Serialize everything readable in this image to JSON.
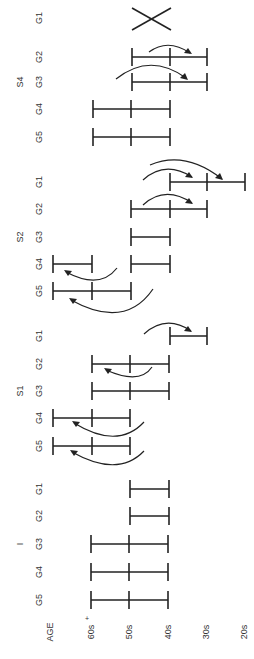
{
  "diagram": {
    "orientation": "rotated-90-ccw",
    "axis": {
      "title": "AGE",
      "ticks": [
        {
          "label": "60s",
          "sup": "+",
          "x": 91
        },
        {
          "label": "50s",
          "sup": "",
          "x": 129
        },
        {
          "label": "40s",
          "sup": "",
          "x": 168
        },
        {
          "label": "30s",
          "sup": "",
          "x": 206
        },
        {
          "label": "20s",
          "sup": "",
          "x": 244
        }
      ]
    },
    "sections": [
      {
        "label": "S4",
        "y": 82,
        "rows": [
          {
            "group": "G1",
            "y": 18,
            "marker": "cross",
            "ticks": []
          },
          {
            "group": "G2",
            "y": 57,
            "ticks": [
              "40s",
              "30s"
            ],
            "extra_left": "50s"
          },
          {
            "group": "G3",
            "y": 82,
            "ticks": [
              "50s",
              "40s",
              "30s"
            ]
          },
          {
            "group": "G4",
            "y": 109,
            "ticks": [
              "60s+",
              "50s",
              "40s"
            ]
          },
          {
            "group": "G5",
            "y": 137,
            "ticks": [
              "60s+",
              "50s",
              "40s"
            ]
          }
        ]
      },
      {
        "label": "S2",
        "y": 237,
        "rows": [
          {
            "group": "G1",
            "y": 182,
            "ticks": [
              "40s",
              "30s",
              "20s"
            ]
          },
          {
            "group": "G2",
            "y": 209,
            "ticks": [
              "50s",
              "40s",
              "30s"
            ]
          },
          {
            "group": "G3",
            "y": 237,
            "ticks": [
              "50s",
              "40s"
            ]
          },
          {
            "group": "G4",
            "y": 264,
            "ticks": [
              "70s",
              "60s+"
            ],
            "second_bar": [
              "50s",
              "40s"
            ]
          },
          {
            "group": "G5",
            "y": 291,
            "ticks": [
              "70s",
              "60s+",
              "50s"
            ]
          }
        ]
      },
      {
        "label": "S1",
        "y": 391,
        "rows": [
          {
            "group": "G1",
            "y": 336,
            "ticks": [
              "40s",
              "30s"
            ]
          },
          {
            "group": "G2",
            "y": 364,
            "ticks": [
              "60s+",
              "50s",
              "40s"
            ]
          },
          {
            "group": "G3",
            "y": 391,
            "ticks": [
              "60s+",
              "50s",
              "40s"
            ]
          },
          {
            "group": "G4",
            "y": 418,
            "ticks": [
              "70s",
              "60s+",
              "50s"
            ]
          },
          {
            "group": "G5",
            "y": 446,
            "ticks": [
              "70s",
              "60s+",
              "50s"
            ]
          }
        ]
      },
      {
        "label": "I",
        "y": 544,
        "rows": [
          {
            "group": "G1",
            "y": 489,
            "ticks": [
              "50s",
              "40s"
            ]
          },
          {
            "group": "G2",
            "y": 516,
            "ticks": [
              "50s",
              "40s"
            ]
          },
          {
            "group": "G3",
            "y": 544,
            "ticks": [
              "60s+",
              "50s",
              "40s"
            ]
          },
          {
            "group": "G4",
            "y": 572,
            "ticks": [
              "60s+",
              "50s",
              "40s"
            ]
          },
          {
            "group": "G5",
            "y": 600,
            "ticks": [
              "60s+",
              "50s",
              "40s"
            ]
          }
        ]
      }
    ],
    "arrows": [
      {
        "section": "S4",
        "from_row": "G2",
        "direction": "younger"
      },
      {
        "section": "S4",
        "from_row": "G3",
        "direction": "younger"
      },
      {
        "section": "S2",
        "from_row": "G1",
        "direction": "younger",
        "count": 2
      },
      {
        "section": "S2",
        "from_row": "G2",
        "direction": "younger"
      },
      {
        "section": "S2",
        "from_row": "G4",
        "direction": "older"
      },
      {
        "section": "S2",
        "from_row": "G5",
        "direction": "older"
      },
      {
        "section": "S1",
        "from_row": "G1",
        "direction": "younger"
      },
      {
        "section": "S1",
        "from_row": "G2",
        "direction": "older"
      },
      {
        "section": "S1",
        "from_row": "G4",
        "direction": "older"
      },
      {
        "section": "S1",
        "from_row": "G5",
        "direction": "older"
      }
    ]
  }
}
